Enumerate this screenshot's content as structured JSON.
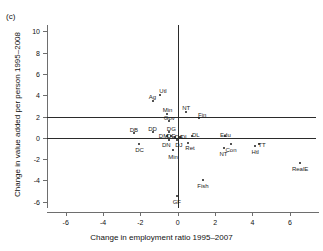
{
  "panel": {
    "label": "(c)"
  },
  "chart_data": {
    "type": "scatter",
    "title": "",
    "xlabel": "Change in employment ratio 1995–2007",
    "ylabel": "Change in value added per person 1995–2008",
    "xlim": [
      -7,
      7.4
    ],
    "ylim": [
      -6.6,
      10.6
    ],
    "xticks": [
      -6,
      -4,
      -2,
      0,
      2,
      4,
      6
    ],
    "xticklabels": [
      "-6",
      "-4",
      "-2",
      "0",
      "2",
      "4",
      "6"
    ],
    "yticks": [
      -6,
      -4,
      -2,
      0,
      2,
      4,
      6,
      8,
      10
    ],
    "yticklabels": [
      "-6",
      "-4",
      "-2",
      "0",
      "2",
      "4",
      "6",
      "8",
      "10"
    ],
    "grid": false,
    "legend": "none",
    "reference_lines": {
      "horizontal": [
        0,
        2
      ],
      "vertical": [
        0
      ]
    },
    "points": [
      {
        "label": "Utl",
        "x": -0.95,
        "y": 4.05,
        "label_dx": 3,
        "label_dy": -7
      },
      {
        "label": "Ag",
        "x": -1.35,
        "y": 3.45,
        "label_dx": 0,
        "label_dy": -7
      },
      {
        "label": "Min",
        "x": -0.55,
        "y": 2.25,
        "label_dx": 0,
        "label_dy": -7
      },
      {
        "label": "NT",
        "x": 0.45,
        "y": 2.45,
        "label_dx": 0,
        "label_dy": -7
      },
      {
        "label": "Fin",
        "x": 1.15,
        "y": 1.85,
        "label_dx": 3,
        "label_dy": -6
      },
      {
        "label": "Gov",
        "x": -0.45,
        "y": 1.55,
        "label_dx": 0,
        "label_dy": -6
      },
      {
        "label": "DB",
        "x": -2.35,
        "y": 0.45,
        "label_dx": 0,
        "label_dy": -6
      },
      {
        "label": "DD",
        "x": -1.35,
        "y": 0.55,
        "label_dx": 0,
        "label_dy": -6
      },
      {
        "label": "DG",
        "x": -0.45,
        "y": 0.55,
        "label_dx": 2,
        "label_dy": -6
      },
      {
        "label": "DC",
        "x": -2.05,
        "y": -0.55,
        "label_dx": 0,
        "label_dy": 3
      },
      {
        "label": "DM",
        "x": -0.55,
        "y": 0.15,
        "label_dx": -4,
        "label_dy": -3
      },
      {
        "label": "DE",
        "x": -0.35,
        "y": 0.15,
        "label_dx": 0,
        "label_dy": -3
      },
      {
        "label": "DA",
        "x": -0.15,
        "y": 0.05,
        "label_dx": 4,
        "label_dy": -3
      },
      {
        "label": "DI",
        "x": 0.1,
        "y": 0.05,
        "label_dx": 4,
        "label_dy": -3
      },
      {
        "label": "DL",
        "x": 0.75,
        "y": 0.15,
        "label_dx": 4,
        "label_dy": -4
      },
      {
        "label": "DN",
        "x": -0.45,
        "y": -0.25,
        "label_dx": -3,
        "label_dy": 2
      },
      {
        "label": "DJ",
        "x": -0.05,
        "y": -0.25,
        "label_dx": 2,
        "label_dy": 2
      },
      {
        "label": "Ret",
        "x": 0.55,
        "y": -0.45,
        "label_dx": 2,
        "label_dy": 2
      },
      {
        "label": "Min",
        "x": -0.25,
        "y": -1.15,
        "label_dx": 0,
        "label_dy": 4
      },
      {
        "label": "Edu",
        "x": 2.55,
        "y": 0.15,
        "label_dx": 0,
        "label_dy": -4
      },
      {
        "label": "Con",
        "x": 2.85,
        "y": -0.55,
        "label_dx": 0,
        "label_dy": 3
      },
      {
        "label": "NT",
        "x": 2.45,
        "y": -0.95,
        "label_dx": 0,
        "label_dy": 3
      },
      {
        "label": "Htl",
        "x": 4.15,
        "y": -0.75,
        "label_dx": 0,
        "label_dy": 3
      },
      {
        "label": "TT",
        "x": 4.35,
        "y": -0.55,
        "label_dx": 3,
        "label_dy": -2
      },
      {
        "label": "RealE",
        "x": 6.55,
        "y": -2.35,
        "label_dx": 0,
        "label_dy": 3
      },
      {
        "label": "Fish",
        "x": 1.35,
        "y": -3.95,
        "label_dx": 0,
        "label_dy": 3
      },
      {
        "label": "GF",
        "x": -0.05,
        "y": -5.45,
        "label_dx": 0,
        "label_dy": 3
      }
    ]
  }
}
